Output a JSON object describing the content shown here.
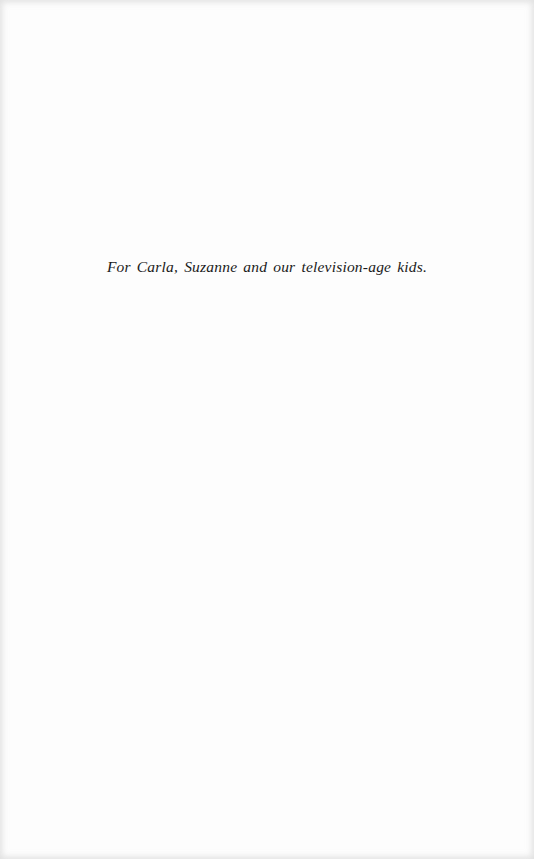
{
  "page": {
    "background_color": "#fdfdfd",
    "text_color": "#1a1a1a"
  },
  "dedication": {
    "text": "For Carla, Suzanne and our television-age kids."
  }
}
